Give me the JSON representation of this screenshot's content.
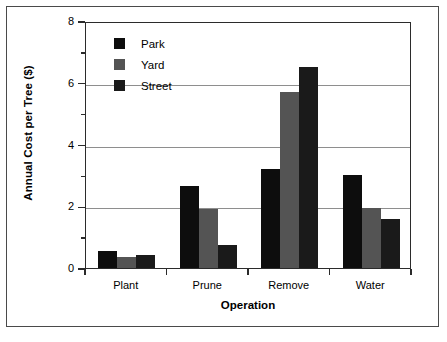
{
  "chart_data": {
    "type": "bar",
    "title": "",
    "subtitle": "",
    "xlabel": "Operation",
    "ylabel": "Annual Cost per Tree ($)",
    "categories": [
      "Plant",
      "Prune",
      "Remove",
      "Water"
    ],
    "series": [
      {
        "name": "Park",
        "color": "#0d0d0d",
        "values": [
          0.55,
          2.65,
          3.2,
          3.0
        ]
      },
      {
        "name": "Yard",
        "color": "#545454",
        "values": [
          0.35,
          1.9,
          5.7,
          1.95
        ]
      },
      {
        "name": "Street",
        "color": "#1a1a1a",
        "values": [
          0.42,
          0.75,
          6.5,
          1.6
        ]
      }
    ],
    "ylim": [
      0,
      8
    ],
    "yticks": [
      0,
      2,
      4,
      6,
      8
    ],
    "ytick_labels": [
      "0",
      "2",
      "4",
      "6",
      "8"
    ],
    "yminor_ticks": [
      1,
      3,
      5,
      7
    ],
    "gridlines": [
      2,
      4,
      6
    ],
    "grid": true,
    "legend_position": "top-left",
    "legend_entries": [
      "Park",
      "Yard",
      "Street"
    ]
  },
  "axis": {
    "y_title": "Annual Cost per Tree ($)",
    "x_title": "Operation"
  },
  "colors": {
    "park": "#0d0d0d",
    "yard": "#545454",
    "street": "#1a1a1a",
    "axis": "#2b2b2b",
    "grid": "#8e8e8e",
    "frame": "#4a4a4a"
  }
}
